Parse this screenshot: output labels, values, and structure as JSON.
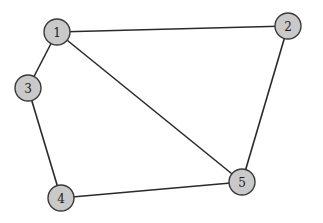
{
  "diagram": {
    "type": "undirected-graph",
    "node_radius": 13,
    "colors": {
      "node_fill": "#c9c9c9",
      "node_stroke": "#3a3a3a",
      "edge": "#2a2a2a",
      "label": "#1a1a1a",
      "background": "#ffffff"
    },
    "nodes": [
      {
        "id": "1",
        "label": "1",
        "x": 57,
        "y": 32
      },
      {
        "id": "2",
        "label": "2",
        "x": 288,
        "y": 26
      },
      {
        "id": "3",
        "label": "3",
        "x": 28,
        "y": 88
      },
      {
        "id": "4",
        "label": "4",
        "x": 61,
        "y": 198
      },
      {
        "id": "5",
        "label": "5",
        "x": 242,
        "y": 182
      }
    ],
    "edges": [
      {
        "from": "1",
        "to": "2"
      },
      {
        "from": "1",
        "to": "3"
      },
      {
        "from": "1",
        "to": "5"
      },
      {
        "from": "2",
        "to": "5"
      },
      {
        "from": "3",
        "to": "4"
      },
      {
        "from": "4",
        "to": "5"
      }
    ]
  }
}
